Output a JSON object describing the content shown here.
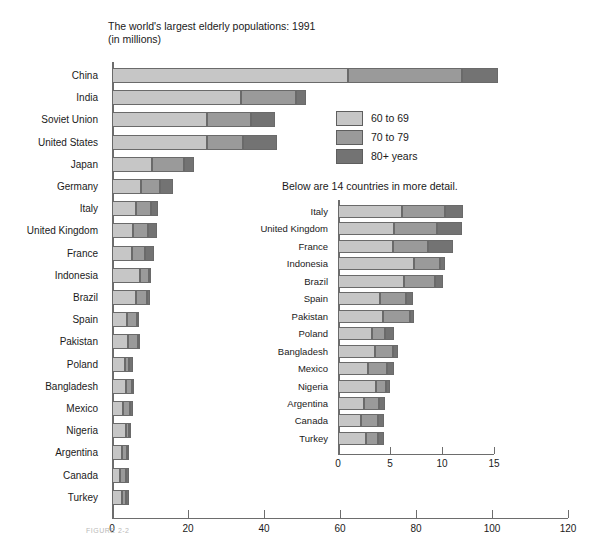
{
  "title": {
    "line1": "The world's largest elderly populations: 1991",
    "line2": "(in millions)"
  },
  "inset_caption": "Below are 14 countries in more detail.",
  "figure_caption": "FIGURE 2-2",
  "legend": {
    "position": "upper-right-inside",
    "items": [
      {
        "label": "60 to 69",
        "color": "#c6c6c6"
      },
      {
        "label": "70 to 79",
        "color": "#9a9a9a"
      },
      {
        "label": "80+ years",
        "color": "#737373"
      }
    ]
  },
  "chart_data": [
    {
      "type": "bar",
      "name": "main",
      "orientation": "horizontal",
      "stacked": true,
      "title": "The world's largest elderly populations: 1991 (in millions)",
      "xlabel": "",
      "ylabel": "",
      "xlim": [
        0,
        120
      ],
      "xticks": [
        0,
        20,
        40,
        60,
        80,
        100,
        120
      ],
      "grid": false,
      "categories": [
        "China",
        "India",
        "Soviet Union",
        "United States",
        "Japan",
        "Germany",
        "Italy",
        "United Kingdom",
        "France",
        "Indonesia",
        "Brazil",
        "Spain",
        "Pakistan",
        "Poland",
        "Bangladesh",
        "Mexico",
        "Nigeria",
        "Argentina",
        "Canada",
        "Turkey"
      ],
      "series": [
        {
          "name": "60 to 69",
          "color": "#c6c6c6",
          "values": [
            62.0,
            34.0,
            25.0,
            25.0,
            10.5,
            7.6,
            6.2,
            5.4,
            5.3,
            7.3,
            6.3,
            4.0,
            4.3,
            3.3,
            3.6,
            2.9,
            3.7,
            2.5,
            2.2,
            2.7
          ]
        },
        {
          "name": "70 to 79",
          "color": "#9a9a9a",
          "values": [
            30.0,
            14.5,
            11.5,
            9.5,
            8.5,
            5.0,
            4.1,
            4.1,
            3.4,
            2.5,
            3.0,
            2.5,
            2.6,
            1.2,
            1.7,
            1.8,
            0.9,
            1.4,
            1.6,
            1.1
          ]
        },
        {
          "name": "80+ years",
          "color": "#737373",
          "values": [
            9.5,
            2.5,
            6.5,
            9.0,
            2.5,
            3.4,
            1.7,
            2.4,
            2.4,
            0.5,
            0.8,
            0.7,
            0.4,
            0.9,
            0.5,
            0.7,
            0.4,
            0.6,
            0.6,
            0.6
          ]
        }
      ]
    },
    {
      "type": "bar",
      "name": "inset",
      "orientation": "horizontal",
      "stacked": true,
      "title": "Below are 14 countries in more detail.",
      "xlabel": "",
      "ylabel": "",
      "xlim": [
        0,
        15
      ],
      "xticks": [
        0,
        5,
        10,
        15
      ],
      "grid": false,
      "categories": [
        "Italy",
        "United Kingdom",
        "France",
        "Indonesia",
        "Brazil",
        "Spain",
        "Pakistan",
        "Poland",
        "Bangladesh",
        "Mexico",
        "Nigeria",
        "Argentina",
        "Canada",
        "Turkey"
      ],
      "series": [
        {
          "name": "60 to 69",
          "color": "#c6c6c6",
          "values": [
            6.2,
            5.4,
            5.3,
            7.3,
            6.3,
            4.0,
            4.3,
            3.3,
            3.6,
            2.9,
            3.7,
            2.5,
            2.2,
            2.7
          ]
        },
        {
          "name": "70 to 79",
          "color": "#9a9a9a",
          "values": [
            4.1,
            4.1,
            3.4,
            2.5,
            3.0,
            2.5,
            2.6,
            1.2,
            1.7,
            1.8,
            0.9,
            1.4,
            1.6,
            1.1
          ]
        },
        {
          "name": "80+ years",
          "color": "#737373",
          "values": [
            1.7,
            2.4,
            2.4,
            0.5,
            0.8,
            0.7,
            0.4,
            0.9,
            0.5,
            0.7,
            0.4,
            0.6,
            0.6,
            0.6
          ]
        }
      ]
    }
  ],
  "layout": {
    "main": {
      "x0": 112,
      "px_per_unit": 3.8,
      "y0": 68,
      "row_pitch": 22.2,
      "bar_h": 15,
      "label_right": 104
    },
    "inset": {
      "x0": 338,
      "px_per_unit": 10.4,
      "y0": 205,
      "row_pitch": 17.45,
      "bar_h": 13,
      "label_right": 334
    }
  }
}
